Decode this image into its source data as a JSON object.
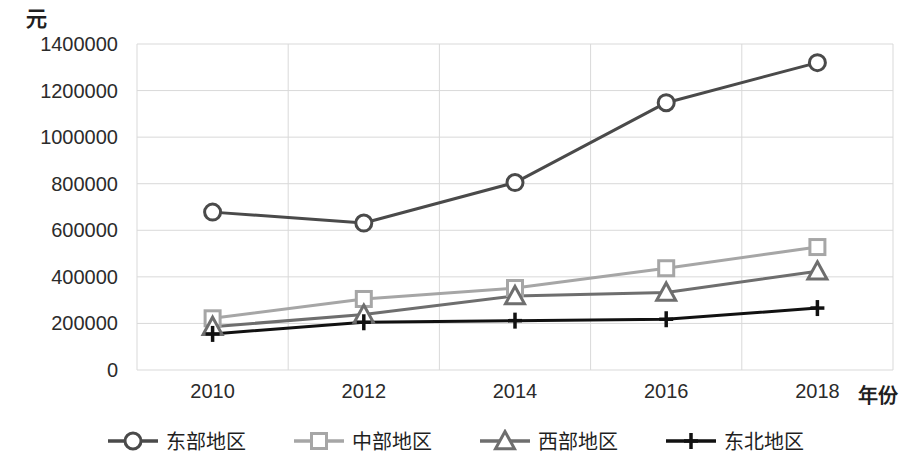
{
  "chart_data": {
    "type": "line",
    "title": "",
    "subtitle": "",
    "xlabel": "年份",
    "ylabel": "元",
    "categories": [
      "2010",
      "2012",
      "2014",
      "2016",
      "2018"
    ],
    "x": [
      2010,
      2012,
      2014,
      2016,
      2018
    ],
    "xlim": [
      2009,
      2019
    ],
    "ylim": [
      0,
      1400000
    ],
    "ytick_step": 200000,
    "yticks": [
      "1400000",
      "1200000",
      "1000000",
      "800000",
      "600000",
      "400000",
      "200000",
      "0"
    ],
    "ytick_values": [
      1400000,
      1200000,
      1000000,
      800000,
      600000,
      400000,
      200000,
      0
    ],
    "grid": true,
    "legend_position": "bottom",
    "series": [
      {
        "name": "东部地区",
        "marker": "circle",
        "color": "#4a4a4a",
        "values": [
          678000,
          631000,
          805000,
          1148000,
          1320000
        ]
      },
      {
        "name": "中部地区",
        "marker": "square",
        "color": "#a6a6a6",
        "values": [
          222000,
          305000,
          352000,
          437000,
          528000
        ]
      },
      {
        "name": "西部地区",
        "marker": "triangle",
        "color": "#6e6e6e",
        "values": [
          186000,
          238000,
          318000,
          333000,
          424000
        ]
      },
      {
        "name": "东北地区",
        "marker": "plus",
        "color": "#111111",
        "values": [
          155000,
          205000,
          212000,
          218000,
          266000
        ]
      }
    ]
  },
  "axis": {
    "unit_label": "元",
    "x_title": "年份"
  },
  "legend": {
    "items": [
      {
        "label": "东部地区"
      },
      {
        "label": "中部地区"
      },
      {
        "label": "西部地区"
      },
      {
        "label": "东北地区"
      }
    ]
  },
  "colors": {
    "east": "#4a4a4a",
    "central": "#a6a6a6",
    "west": "#6e6e6e",
    "northeast": "#111111",
    "grid": "#d9d9d9",
    "text": "#2b2b2b"
  }
}
